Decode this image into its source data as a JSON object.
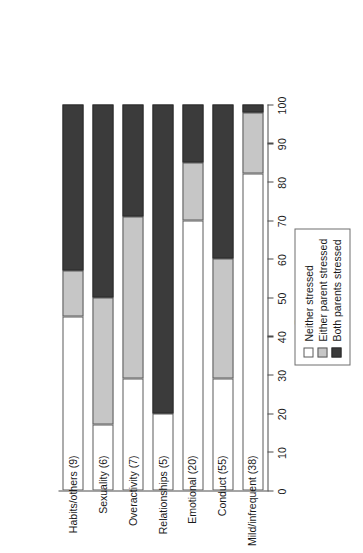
{
  "chart_data": {
    "type": "bar",
    "orientation": "horizontal-stacked",
    "title": "",
    "xlabel": "Percentage",
    "ylabel": "",
    "xlim": [
      0,
      100
    ],
    "xticks": [
      0,
      10,
      20,
      30,
      40,
      50,
      60,
      70,
      80,
      90,
      100
    ],
    "grid": false,
    "legend_position": "left-of-plot",
    "stacked_total": 100,
    "categories": [
      "Habits/others (9)",
      "Sexuality (6)",
      "Overactivity (7)",
      "Relationships (5)",
      "Emotional (20)",
      "Conduct (55)",
      "Mild/infrequent (38)"
    ],
    "series": [
      {
        "name": "Neither stressed",
        "color": "#ffffff",
        "values": [
          45,
          17,
          29,
          20,
          70,
          29,
          82
        ]
      },
      {
        "name": "Either parent stressed",
        "color": "#c6c6c6",
        "values": [
          12,
          33,
          42,
          0,
          15,
          31,
          16
        ]
      },
      {
        "name": "Both parents stressed",
        "color": "#3b3b3b",
        "values": [
          43,
          50,
          29,
          80,
          15,
          40,
          2
        ]
      }
    ]
  },
  "legend": {
    "items": [
      {
        "label": "Neither stressed",
        "key": "neither"
      },
      {
        "label": "Either parent stressed",
        "key": "either"
      },
      {
        "label": "Both parents stressed",
        "key": "both"
      }
    ]
  },
  "axis": {
    "title": "Percentage",
    "tick_labels": [
      "0",
      "10",
      "20",
      "30",
      "40",
      "50",
      "60",
      "70",
      "80",
      "90",
      "100"
    ]
  }
}
